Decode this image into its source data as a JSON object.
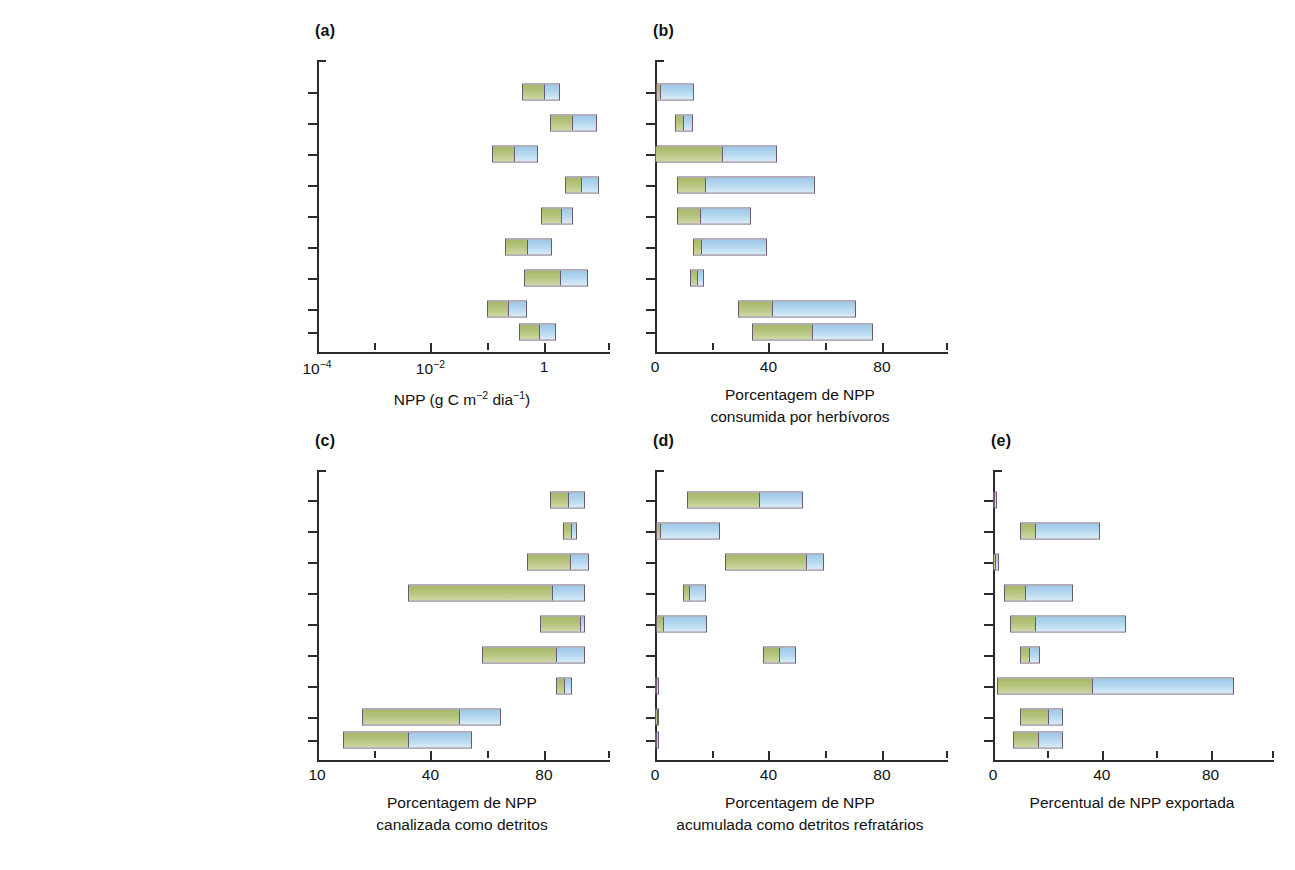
{
  "figure": {
    "categories_top": [
      "Florestas e matagais",
      "Manguezais",
      "Prados",
      "Pântanos",
      "Prados de ervas marinhas",
      "Prados de macrófitas de água doce",
      "Loitos de macroalgas",
      "Leitos de microalgas bentônicas",
      "Comunidades fitoplanctônicas"
    ],
    "categories_bottom": [
      "Florestas e malagais",
      "Manguezais",
      "Prados",
      "Pântanos",
      "Prados de ervas marinhas",
      "Pradoo do macrófitas de água doce",
      "Leitos de macroalgas",
      "Leitos de microalgas bentônicas",
      "Comunidades fitoplanctônicas"
    ],
    "colors": {
      "segment_low": "#b4c37c",
      "segment_high": "#b2d6ef",
      "outline": "#6b5a72",
      "axis": "#2b2b2b",
      "text": "#1a1a1a"
    },
    "panel_tags": [
      "(a)",
      "(b)",
      "(c)",
      "(d)",
      "(e)"
    ]
  },
  "chart_data": [
    {
      "type": "bar",
      "id": "a",
      "panel": "(a)",
      "title": "",
      "xlabel": "NPP (g C m−2 dia−1)",
      "xlabel_lines": [
        "NPP (g C m",
        "−2",
        " dia",
        "−1",
        ")"
      ],
      "ylabel": "",
      "scale": "log",
      "xlim": [
        0.0001,
        10
      ],
      "xticks": [
        0.0001,
        0.001,
        0.01,
        0.1,
        1,
        10
      ],
      "xticklabels": [
        "10−4",
        "",
        "10−2",
        "",
        "1",
        ""
      ],
      "grid": false,
      "orientation": "horizontal",
      "note": "Each bar spans low–high range; internal divider marks the mid/median value.",
      "categories": [
        "Florestas e matagais",
        "Manguezais",
        "Prados",
        "Pântanos",
        "Prados de ervas marinhas",
        "Prados de macrófitas de água doce",
        "Loitos de macroalgas",
        "Leitos de microalgas bentônicas",
        "Comunidades fitoplanctônicas"
      ],
      "bars": [
        {
          "category": "Florestas e matagais",
          "low": 0.33,
          "mid": 0.8,
          "high": 1.5
        },
        {
          "category": "Manguezais",
          "low": 1.0,
          "mid": 2.4,
          "high": 6.5
        },
        {
          "category": "Prados",
          "low": 0.1,
          "mid": 0.24,
          "high": 0.62
        },
        {
          "category": "Pântanos",
          "low": 1.8,
          "mid": 3.4,
          "high": 7.0
        },
        {
          "category": "Prados de ervas marinhas",
          "low": 0.72,
          "mid": 1.6,
          "high": 2.5
        },
        {
          "category": "Prados de macrófitas de água doce",
          "low": 0.17,
          "mid": 0.4,
          "high": 1.1
        },
        {
          "category": "Loitos de macroalgas",
          "low": 0.36,
          "mid": 1.5,
          "high": 4.6
        },
        {
          "category": "Leitos de microalgas bentônicas",
          "low": 0.085,
          "mid": 0.19,
          "high": 0.4
        },
        {
          "category": "Comunidades fitoplanctônicas",
          "low": 0.3,
          "mid": 0.65,
          "high": 1.3
        }
      ]
    },
    {
      "type": "bar",
      "id": "b",
      "panel": "(b)",
      "title": "",
      "xlabel": "Porcentagem de NPP consumida por herbívoros",
      "xlabel_lines": [
        "Porcentagem de NPP",
        "consumida por herbívoros"
      ],
      "ylabel": "",
      "scale": "linear",
      "xlim": [
        0,
        100
      ],
      "xticks": [
        0,
        20,
        40,
        60,
        80,
        100
      ],
      "xticklabels": [
        "0",
        "",
        "40",
        "",
        "80",
        ""
      ],
      "grid": false,
      "orientation": "horizontal",
      "categories": [
        "Florestas e matagais",
        "Manguezais",
        "Prados",
        "Pântanos",
        "Prados de ervas marinhas",
        "Prados de macrófitas de água doce",
        "Loitos de macroalgas",
        "Leitos de microalgas bentônicas",
        "Comunidades fitoplanctônicas"
      ],
      "bars": [
        {
          "category": "Florestas e matagais",
          "low": 0.3,
          "mid": 1.6,
          "high": 13.5
        },
        {
          "category": "Manguezais",
          "low": 7.0,
          "mid": 9.5,
          "high": 13.0
        },
        {
          "category": "Prados",
          "low": 0.0,
          "mid": 23.0,
          "high": 42.0
        },
        {
          "category": "Pântanos",
          "low": 7.5,
          "mid": 17.0,
          "high": 55.0
        },
        {
          "category": "Prados de ervas marinhas",
          "low": 7.5,
          "mid": 15.5,
          "high": 33.0
        },
        {
          "category": "Prados de macrófitas de água doce",
          "low": 13.0,
          "mid": 15.5,
          "high": 38.5
        },
        {
          "category": "Loitos de macroalgas",
          "low": 12.0,
          "mid": 14.5,
          "high": 17.0
        },
        {
          "category": "Leitos de microalgas bentônicas",
          "low": 28.5,
          "mid": 40.0,
          "high": 69.0
        },
        {
          "category": "Comunidades fitoplanctônicas",
          "low": 33.5,
          "mid": 54.0,
          "high": 75.0
        }
      ]
    },
    {
      "type": "bar",
      "id": "c",
      "panel": "(c)",
      "title": "",
      "xlabel": "Porcentagem de NPP canalizada como detritos",
      "xlabel_lines": [
        "Porcentagem de NPP",
        "canalizada como detritos"
      ],
      "ylabel": "",
      "scale": "linear",
      "xlim": [
        10,
        100
      ],
      "xticks": [
        10,
        25,
        40,
        55,
        80,
        100
      ],
      "xticklabels": [
        "10",
        "",
        "40",
        "",
        "80",
        ""
      ],
      "grid": false,
      "orientation": "horizontal",
      "categories": [
        "Florestas e malagais",
        "Manguezais",
        "Prados",
        "Pântanos",
        "Prados de ervas marinhas",
        "Pradoo do macrófitas de água doce",
        "Leitos de macroalgas",
        "Leitos de microalgas bentônicas",
        "Comunidades fitoplanctônicas"
      ],
      "bars": [
        {
          "category": "Florestas e malagais",
          "low": 82.0,
          "mid": 87.5,
          "high": 93.0
        },
        {
          "category": "Manguezais",
          "low": 86.0,
          "mid": 88.5,
          "high": 90.5
        },
        {
          "category": "Prados",
          "low": 75.0,
          "mid": 88.5,
          "high": 94.0
        },
        {
          "category": "Pântanos",
          "low": 38.0,
          "mid": 83.0,
          "high": 93.0
        },
        {
          "category": "Prados de ervas marinhas",
          "low": 79.0,
          "mid": 91.5,
          "high": 93.0
        },
        {
          "category": "Pradoo do macrófitas de água doce",
          "low": 61.0,
          "mid": 84.0,
          "high": 93.0
        },
        {
          "category": "Leitos de macroalgas",
          "low": 84.0,
          "mid": 86.5,
          "high": 89.0
        },
        {
          "category": "Leitos de microalgas bentônicas",
          "low": 24.0,
          "mid": 54.0,
          "high": 67.0
        },
        {
          "category": "Comunidades fitoplanctônicas",
          "low": 18.0,
          "mid": 38.0,
          "high": 58.0
        }
      ]
    },
    {
      "type": "bar",
      "id": "d",
      "panel": "(d)",
      "title": "",
      "xlabel": "Porcentagem de NPP acumulada como detritos refratários",
      "xlabel_lines": [
        "Porcentagem de NPP",
        "acumulada como detritos refratários"
      ],
      "ylabel": "",
      "scale": "linear",
      "xlim": [
        0,
        100
      ],
      "xticks": [
        0,
        20,
        40,
        60,
        80,
        100
      ],
      "xticklabels": [
        "0",
        "",
        "40",
        "",
        "80",
        ""
      ],
      "grid": false,
      "orientation": "horizontal",
      "categories": [
        "Florestas e malagais",
        "Manguezais",
        "Prados",
        "Pântanos",
        "Prados de ervas marinhas",
        "Pradoo do macrófitas de água doce",
        "Leitos de macroalgas",
        "Leitos de microalgas bentônicas",
        "Comunidades fitoplanctônicas"
      ],
      "bars": [
        {
          "category": "Florestas e malagais",
          "low": 11.0,
          "mid": 36.0,
          "high": 51.0
        },
        {
          "category": "Manguezais",
          "low": 0.3,
          "mid": 1.5,
          "high": 22.5
        },
        {
          "category": "Prados",
          "low": 24.0,
          "mid": 52.0,
          "high": 58.0
        },
        {
          "category": "Pântanos",
          "low": 9.5,
          "mid": 11.5,
          "high": 17.5
        },
        {
          "category": "Prados de ervas marinhas",
          "low": 0.3,
          "mid": 2.5,
          "high": 18.0
        },
        {
          "category": "Pradoo do macrófitas de água doce",
          "low": 37.0,
          "mid": 42.5,
          "high": 48.5
        },
        {
          "category": "Leitos de macroalgas",
          "low": 0.0,
          "mid": 0.2,
          "high": 0.5
        },
        {
          "category": "Leitos de microalgas bentônicas",
          "low": 0.0,
          "mid": 0.4,
          "high": 1.3
        },
        {
          "category": "Comunidades fitoplanctônicas",
          "low": 0.0,
          "mid": 0.3,
          "high": 0.8
        }
      ]
    },
    {
      "type": "bar",
      "id": "e",
      "panel": "(e)",
      "title": "",
      "xlabel": "Percentual de NPP exportada",
      "xlabel_lines": [
        "Percentual de NPP exportada"
      ],
      "ylabel": "",
      "scale": "linear",
      "xlim": [
        0,
        100
      ],
      "xticks": [
        0,
        20,
        40,
        60,
        80,
        100
      ],
      "xticklabels": [
        "0",
        "",
        "40",
        "",
        "80",
        ""
      ],
      "grid": false,
      "orientation": "horizontal",
      "categories": [
        "Florestas e malagais",
        "Manguezais",
        "Prados",
        "Pântanos",
        "Prados de ervas marinhas",
        "Pradoo do macrófitas de água doce",
        "Leitos de macroalgas",
        "Leitos de microalgas bentônicas",
        "Comunidades fitoplanctônicas"
      ],
      "bars": [
        {
          "category": "Florestas e malagais",
          "low": 0.0,
          "mid": 0.3,
          "high": 0.8
        },
        {
          "category": "Manguezais",
          "low": 9.5,
          "mid": 15.0,
          "high": 38.5
        },
        {
          "category": "Prados",
          "low": 0.0,
          "mid": 0.6,
          "high": 2.0
        },
        {
          "category": "Pântanos",
          "low": 4.0,
          "mid": 11.5,
          "high": 28.5
        },
        {
          "category": "Prados de ervas marinhas",
          "low": 6.0,
          "mid": 15.0,
          "high": 47.5
        },
        {
          "category": "Pradoo do macrófitas de água doce",
          "low": 9.5,
          "mid": 13.0,
          "high": 17.0
        },
        {
          "category": "Leitos de macroalgas",
          "low": 1.5,
          "mid": 35.5,
          "high": 86.5
        },
        {
          "category": "Leitos de microalgas bentônicas",
          "low": 9.5,
          "mid": 20.0,
          "high": 25.0
        },
        {
          "category": "Comunidades fitoplanctônicas",
          "low": 7.0,
          "mid": 16.0,
          "high": 25.0
        }
      ]
    }
  ]
}
